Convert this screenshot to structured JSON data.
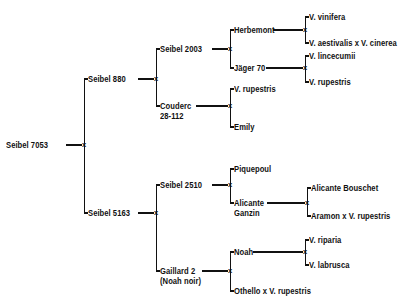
{
  "diagram": {
    "junction_symbol": "x",
    "line_color": "#111111",
    "text_color": "#111111",
    "background_color": "#ffffff",
    "nodes": {
      "root": "Seibel 7053",
      "seibel_880": "Seibel 880",
      "seibel_5163": "Seibel 5163",
      "seibel_2003": "Seibel 2003",
      "couderc_line1": "Couderc",
      "couderc_line2": "28-112",
      "seibel_2510": "Seibel 2510",
      "gaillard_line1": "Gaillard 2",
      "gaillard_line2": "(Noah noir)",
      "herbemont": "Herbemont",
      "jager_70": "Jäger 70",
      "v_rupestris_couderc": "V. rupestris",
      "emily": "Emily",
      "piquepoul": "Piquepoul",
      "alicante_ganzin_line1": "Alicante",
      "alicante_ganzin_line2": "Ganzin",
      "noah": "Noah",
      "othello_x_v_rupestris": "Othello x V. rupestris",
      "v_vinifera": "V. vinifera",
      "v_aestivalis_x_v_cinerea": "V. aestivalis x V. cinerea",
      "v_lincecumii": "V. lincecumii",
      "v_rupestris_jager": "V. rupestris",
      "alicante_bouschet": "Alicante Bouschet",
      "aramon_x_v_rupestris": "Aramon x V. rupestris",
      "v_riparia": "V. riparia",
      "v_labrusca": "V. labrusca"
    },
    "junctions": [
      {
        "name": "junction-root",
        "label": "x"
      },
      {
        "name": "junction-seibel-880",
        "label": "x"
      },
      {
        "name": "junction-seibel-5163",
        "label": "x"
      },
      {
        "name": "junction-seibel-2003",
        "label": "x"
      },
      {
        "name": "junction-couderc",
        "label": "x"
      },
      {
        "name": "junction-seibel-2510",
        "label": "x"
      },
      {
        "name": "junction-gaillard-2",
        "label": "x"
      },
      {
        "name": "junction-herbemont",
        "label": "x"
      },
      {
        "name": "junction-jager-70",
        "label": "x"
      },
      {
        "name": "junction-alicante-ganzin",
        "label": "x"
      },
      {
        "name": "junction-noah",
        "label": "x"
      }
    ]
  }
}
